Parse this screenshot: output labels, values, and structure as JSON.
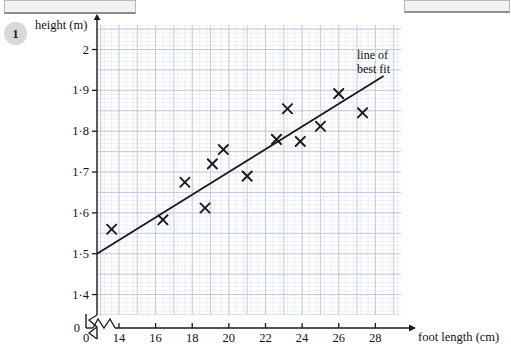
{
  "header": {
    "left_bar": "",
    "right_bar": ""
  },
  "question": {
    "number": "1"
  },
  "chart_data": {
    "type": "scatter",
    "title": "",
    "xlabel": "foot length (cm)",
    "ylabel": "height (m)",
    "xlim": [
      12.8,
      29.4
    ],
    "ylim": [
      1.35,
      2.06
    ],
    "grid": true,
    "minor_grid": true,
    "axis_break_x": true,
    "axis_break_y": true,
    "x_origin_label": "0",
    "y_origin_label": "0",
    "xticks": [
      14,
      16,
      18,
      20,
      22,
      24,
      26,
      28
    ],
    "xtick_labels": [
      "14",
      "16",
      "18",
      "20",
      "22",
      "24",
      "26",
      "28"
    ],
    "yticks": [
      1.4,
      1.5,
      1.6,
      1.7,
      1.8,
      1.9,
      2.0
    ],
    "ytick_labels": [
      "1·4",
      "1·5",
      "1·6",
      "1·7",
      "1·8",
      "1·9",
      "2"
    ],
    "points": [
      {
        "x": 13.6,
        "y": 1.56
      },
      {
        "x": 16.4,
        "y": 1.583
      },
      {
        "x": 17.6,
        "y": 1.675
      },
      {
        "x": 18.7,
        "y": 1.612
      },
      {
        "x": 19.1,
        "y": 1.72
      },
      {
        "x": 19.7,
        "y": 1.755
      },
      {
        "x": 21.0,
        "y": 1.69
      },
      {
        "x": 22.6,
        "y": 1.78
      },
      {
        "x": 23.2,
        "y": 1.855
      },
      {
        "x": 23.9,
        "y": 1.775
      },
      {
        "x": 25.0,
        "y": 1.812
      },
      {
        "x": 26.0,
        "y": 1.892
      },
      {
        "x": 27.3,
        "y": 1.845
      }
    ],
    "marker": "x",
    "marker_color": "#1a1a1a",
    "line_of_best_fit": {
      "label_line_1": "line of",
      "label_line_2": "best fit",
      "x1": 12.8,
      "y1": 1.5,
      "x2": 28.45,
      "y2": 1.935,
      "color": "#1a1a1a"
    },
    "grid_color": "#b9c4d4",
    "minor_grid_color": "#dfe5ee",
    "axis_color": "#1a1a1a"
  }
}
